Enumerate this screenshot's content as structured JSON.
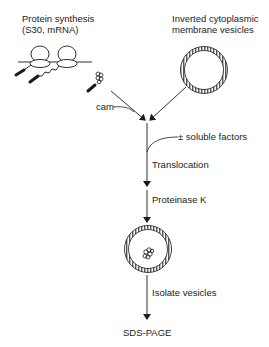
{
  "diagram": {
    "type": "flow",
    "inputs": {
      "protein_synthesis": {
        "line1": "Protein synthesis",
        "line2": "(S30, mRNA)"
      },
      "vesicles": {
        "line1": "Inverted cytoplasmic",
        "line2": "membrane vesicles"
      }
    },
    "side_labels": {
      "cam": "cam",
      "soluble_factors": "± soluble factors"
    },
    "steps": [
      {
        "label": "Translocation"
      },
      {
        "label": "Proteinase K"
      },
      {
        "label": "Isolate vesicles"
      }
    ],
    "output": "SDS-PAGE",
    "colors": {
      "line": "#1a1a1a",
      "background": "#ffffff"
    }
  }
}
